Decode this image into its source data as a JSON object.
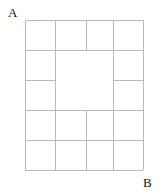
{
  "figure": {
    "background_color": "#ffffff",
    "line_color": "#b9b9b9",
    "line_width": 1,
    "label_color": "#101010"
  },
  "labels": {
    "top_left": "A",
    "bottom_right": "B"
  },
  "chart_data": {
    "type": "diagram",
    "title": "",
    "xlabel": "",
    "ylabel": "",
    "frame": {
      "x0": 25,
      "y0": 20,
      "x1": 143,
      "y1": 170
    },
    "vertical_gridlines_x": [
      55,
      86,
      113
    ],
    "horizontal_gridlines_y": [
      50,
      80,
      110,
      140
    ],
    "open_center": {
      "x0": 55,
      "y0": 50,
      "x1": 113,
      "y1": 110
    },
    "segments": [
      {
        "name": "frame-top",
        "x1": 25,
        "y1": 20,
        "x2": 143,
        "y2": 20
      },
      {
        "name": "frame-bottom",
        "x1": 25,
        "y1": 170,
        "x2": 143,
        "y2": 170
      },
      {
        "name": "frame-left",
        "x1": 25,
        "y1": 20,
        "x2": 25,
        "y2": 170
      },
      {
        "name": "frame-right",
        "x1": 143,
        "y1": 20,
        "x2": 143,
        "y2": 170
      },
      {
        "name": "h-row1-full",
        "x1": 25,
        "y1": 50,
        "x2": 143,
        "y2": 50
      },
      {
        "name": "h-row2-left",
        "x1": 25,
        "y1": 80,
        "x2": 55,
        "y2": 80
      },
      {
        "name": "h-row2-right",
        "x1": 113,
        "y1": 80,
        "x2": 143,
        "y2": 80
      },
      {
        "name": "h-row3-full",
        "x1": 25,
        "y1": 110,
        "x2": 143,
        "y2": 110
      },
      {
        "name": "h-row4-full",
        "x1": 25,
        "y1": 140,
        "x2": 143,
        "y2": 140
      },
      {
        "name": "v-col1-full",
        "x1": 55,
        "y1": 20,
        "x2": 55,
        "y2": 170
      },
      {
        "name": "v-col2-toprow",
        "x1": 86,
        "y1": 20,
        "x2": 86,
        "y2": 50
      },
      {
        "name": "v-col2-row4",
        "x1": 86,
        "y1": 110,
        "x2": 86,
        "y2": 170
      },
      {
        "name": "v-col3-full",
        "x1": 113,
        "y1": 20,
        "x2": 113,
        "y2": 170
      }
    ]
  }
}
